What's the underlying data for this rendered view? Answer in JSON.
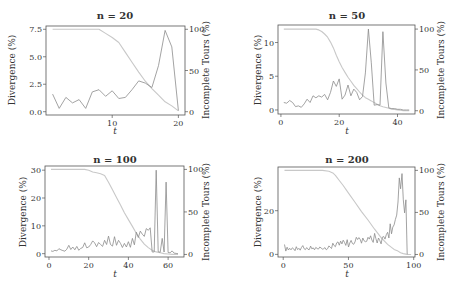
{
  "figure": {
    "left_axis_label": "Divergence (%)",
    "right_axis_label": "Incomplete Tours (%)",
    "x_axis_label": "t",
    "colors": {
      "divergence_line": "#8c8c8c",
      "incomplete_line": "#c8c8c8",
      "frame": "#555555",
      "text": "#333333"
    }
  },
  "chart_data": [
    {
      "type": "line",
      "title": "n = 20",
      "xlabel": "t",
      "ylabel": "Divergence (%)",
      "y2label": "Incomplete Tours (%)",
      "xlim": [
        0,
        21
      ],
      "ylim": [
        -0.3,
        7.8
      ],
      "y2lim": [
        -4,
        104
      ],
      "xticks": [
        10,
        20
      ],
      "yticks": [
        0.0,
        2.5,
        5.0,
        7.5
      ],
      "ytick_labels": [
        "0.0",
        "2.5",
        "5.0",
        "7.5"
      ],
      "y2ticks": [
        0,
        50,
        100
      ],
      "grid": false,
      "series": [
        {
          "name": "Divergence (%)",
          "axis": "left",
          "x": [
            1,
            2,
            3,
            4,
            5,
            6,
            7,
            8,
            9,
            10,
            11,
            12,
            13,
            14,
            15,
            16,
            17,
            18,
            19,
            20
          ],
          "values": [
            1.6,
            0.3,
            1.3,
            0.8,
            1.1,
            0.3,
            1.8,
            2.0,
            1.4,
            1.9,
            1.2,
            1.3,
            2.0,
            2.8,
            2.6,
            2.2,
            4.2,
            7.4,
            5.9,
            0.1
          ]
        },
        {
          "name": "Incomplete Tours (%)",
          "axis": "right",
          "x": [
            1,
            2,
            3,
            4,
            5,
            6,
            7,
            8,
            9,
            10,
            11,
            12,
            13,
            14,
            15,
            16,
            17,
            18,
            19,
            20
          ],
          "values": [
            100,
            100,
            100,
            100,
            100,
            100,
            100,
            100,
            95,
            90,
            84,
            72,
            60,
            48,
            37,
            28,
            20,
            12,
            7,
            1
          ]
        }
      ]
    },
    {
      "type": "line",
      "title": "n = 50",
      "xlabel": "t",
      "ylabel": "Divergence (%)",
      "y2label": "Incomplete Tours (%)",
      "xlim": [
        -1,
        46
      ],
      "ylim": [
        -0.6,
        12.6
      ],
      "y2lim": [
        -4,
        105
      ],
      "xticks": [
        0,
        20,
        40
      ],
      "yticks": [
        0,
        5,
        10
      ],
      "ytick_labels": [
        "0",
        "5",
        "10"
      ],
      "y2ticks": [
        0,
        50,
        100
      ],
      "grid": false,
      "series": [
        {
          "name": "Divergence (%)",
          "axis": "left",
          "x": [
            1,
            2,
            3,
            4,
            5,
            6,
            7,
            8,
            9,
            10,
            11,
            12,
            13,
            14,
            15,
            16,
            17,
            18,
            19,
            20,
            21,
            22,
            23,
            24,
            25,
            26,
            27,
            28,
            29,
            30,
            31,
            32,
            33,
            34,
            35,
            36,
            37,
            38,
            39,
            40,
            41,
            42,
            43,
            44
          ],
          "values": [
            1.1,
            1.0,
            1.4,
            1.1,
            0.5,
            0.6,
            0.4,
            0.9,
            1.6,
            1.1,
            2.1,
            1.8,
            2.1,
            1.9,
            2.3,
            1.5,
            2.6,
            4.3,
            3.5,
            4.6,
            1.6,
            2.2,
            3.7,
            2.1,
            3.1,
            2.6,
            1.5,
            2.0,
            5.5,
            12.0,
            7.0,
            0.7,
            0.8,
            0.7,
            11.6,
            4.0,
            0.3,
            0.2,
            0.2,
            0.1,
            0.1,
            0.0,
            0.0,
            0.0
          ]
        },
        {
          "name": "Incomplete Tours (%)",
          "axis": "right",
          "x": [
            1,
            2,
            3,
            4,
            5,
            6,
            7,
            8,
            9,
            10,
            11,
            12,
            13,
            14,
            15,
            16,
            17,
            18,
            19,
            20,
            21,
            22,
            23,
            24,
            25,
            26,
            27,
            28,
            29,
            30,
            31,
            32,
            33,
            34,
            35,
            36,
            37,
            38,
            39,
            40,
            41,
            42,
            43,
            44
          ],
          "values": [
            100,
            100,
            100,
            100,
            100,
            100,
            100,
            100,
            100,
            100,
            100,
            100,
            99,
            97,
            94,
            90,
            84,
            77,
            68,
            60,
            53,
            47,
            41,
            36,
            31,
            27,
            23,
            19,
            16,
            14,
            12,
            10,
            8,
            6,
            5,
            4,
            3,
            2,
            1.5,
            1,
            0.5,
            0,
            0,
            0
          ]
        }
      ]
    },
    {
      "type": "line",
      "title": "n = 100",
      "xlabel": "t",
      "ylabel": "Divergence (%)",
      "y2label": "Incomplete Tours (%)",
      "xlim": [
        -2,
        68
      ],
      "ylim": [
        -1.2,
        31.5
      ],
      "y2lim": [
        -3,
        104
      ],
      "xticks": [
        0,
        20,
        40,
        60
      ],
      "yticks": [
        0,
        10,
        20,
        30
      ],
      "ytick_labels": [
        "0",
        "10",
        "20",
        "30"
      ],
      "y2ticks": [
        0,
        50,
        100
      ],
      "grid": false,
      "series": [
        {
          "name": "Divergence (%)",
          "axis": "left",
          "x": [
            1,
            2,
            3,
            4,
            5,
            6,
            7,
            8,
            9,
            10,
            11,
            12,
            13,
            14,
            15,
            16,
            17,
            18,
            19,
            20,
            21,
            22,
            23,
            24,
            25,
            26,
            27,
            28,
            29,
            30,
            31,
            32,
            33,
            34,
            35,
            36,
            37,
            38,
            39,
            40,
            41,
            42,
            43,
            44,
            45,
            46,
            47,
            48,
            49,
            50,
            51,
            52,
            53,
            54,
            55,
            56,
            57,
            58,
            59,
            60,
            61,
            62,
            63,
            64,
            65
          ],
          "values": [
            1.0,
            0.8,
            1.2,
            1.0,
            1.8,
            1.4,
            1.1,
            0.9,
            1.6,
            3.0,
            1.5,
            2.4,
            1.4,
            2.6,
            1.2,
            1.9,
            2.2,
            3.9,
            2.1,
            2.4,
            3.3,
            4.6,
            3.9,
            2.5,
            4.0,
            3.3,
            2.6,
            4.8,
            3.3,
            6.3,
            3.3,
            2.7,
            6.1,
            3.0,
            4.8,
            3.7,
            2.2,
            3.7,
            2.4,
            4.3,
            2.3,
            5.5,
            3.2,
            7.7,
            5.8,
            8.1,
            7.0,
            6.2,
            9.0,
            8.4,
            9.3,
            0.6,
            0.6,
            30.0,
            0.7,
            0.5,
            5.5,
            0.6,
            25.7,
            0.4,
            0.3,
            1.0,
            0.2,
            0.1,
            0.0
          ]
        },
        {
          "name": "Incomplete Tours (%)",
          "axis": "right",
          "x": [
            1,
            5,
            10,
            15,
            18,
            20,
            22,
            24,
            26,
            28,
            30,
            32,
            34,
            36,
            38,
            40,
            42,
            44,
            46,
            48,
            50,
            52,
            54,
            56,
            58,
            60,
            62,
            64,
            65
          ],
          "values": [
            100,
            100,
            100,
            100,
            100,
            99,
            97,
            96,
            95,
            93,
            85,
            76,
            67,
            58,
            49,
            41,
            33,
            25,
            18,
            12,
            8,
            5,
            3,
            2,
            1,
            0.5,
            0,
            0,
            0
          ]
        }
      ]
    },
    {
      "type": "line",
      "title": "n = 200",
      "xlabel": "t",
      "ylabel": "Divergence (%)",
      "y2label": "Incomplete Tours (%)",
      "xlim": [
        -4,
        101
      ],
      "ylim": [
        -1.2,
        40
      ],
      "y2lim": [
        -3,
        104
      ],
      "xticks": [
        0,
        50,
        100
      ],
      "yticks": [
        0,
        20
      ],
      "ytick_labels": [
        "0",
        "20"
      ],
      "y2ticks": [
        0,
        50,
        100
      ],
      "grid": false,
      "series": [
        {
          "name": "Divergence (%)",
          "axis": "left",
          "x": [
            1,
            2,
            3,
            4,
            5,
            6,
            7,
            8,
            9,
            10,
            11,
            12,
            13,
            14,
            15,
            16,
            17,
            18,
            19,
            20,
            21,
            22,
            23,
            24,
            25,
            26,
            27,
            28,
            29,
            30,
            31,
            32,
            33,
            34,
            35,
            36,
            37,
            38,
            39,
            40,
            41,
            42,
            43,
            44,
            45,
            46,
            47,
            48,
            49,
            50,
            51,
            52,
            53,
            54,
            55,
            56,
            57,
            58,
            59,
            60,
            61,
            62,
            63,
            64,
            65,
            66,
            67,
            68,
            69,
            70,
            71,
            72,
            73,
            74,
            75,
            76,
            77,
            78,
            79,
            80,
            81,
            82,
            83,
            84,
            85,
            86,
            87,
            88,
            89,
            90,
            91,
            92,
            93,
            94,
            95
          ],
          "values": [
            4.5,
            1.5,
            3.3,
            2.0,
            2.8,
            2.1,
            3.0,
            2.5,
            1.7,
            3.5,
            2.2,
            2.8,
            1.9,
            3.2,
            4.0,
            2.6,
            2.2,
            3.1,
            2.3,
            2.2,
            3.8,
            2.5,
            3.0,
            2.1,
            3.2,
            2.7,
            2.4,
            3.4,
            2.9,
            2.4,
            2.6,
            3.1,
            2.1,
            2.6,
            3.9,
            3.3,
            2.7,
            5.1,
            4.0,
            3.5,
            5.3,
            5.7,
            4.2,
            6.1,
            4.8,
            6.5,
            5.5,
            4.1,
            6.7,
            3.4,
            5.2,
            6.4,
            5.0,
            4.6,
            5.7,
            7.8,
            6.8,
            7.7,
            6.9,
            5.1,
            7.5,
            6.2,
            5.8,
            6.0,
            7.8,
            7.0,
            8.5,
            6.6,
            5.5,
            9.6,
            7.2,
            5.2,
            7.5,
            6.3,
            4.8,
            7.9,
            8.2,
            7.0,
            9.0,
            10.1,
            7.5,
            14.0,
            9.4,
            12.5,
            13.5,
            16.0,
            18.0,
            24.0,
            35.0,
            30.0,
            37.0,
            25.0,
            19.0,
            25.0,
            0.0
          ]
        },
        {
          "name": "Incomplete Tours (%)",
          "axis": "right",
          "x": [
            1,
            10,
            20,
            30,
            35,
            38,
            40,
            43,
            46,
            50,
            55,
            60,
            65,
            70,
            75,
            80,
            85,
            88,
            90,
            92,
            94,
            96,
            98
          ],
          "values": [
            100,
            100,
            100,
            100,
            99,
            97,
            94,
            88,
            82,
            73,
            62,
            51,
            41,
            30,
            20,
            12,
            6,
            4,
            2,
            1,
            0.5,
            0,
            0
          ]
        }
      ]
    }
  ]
}
